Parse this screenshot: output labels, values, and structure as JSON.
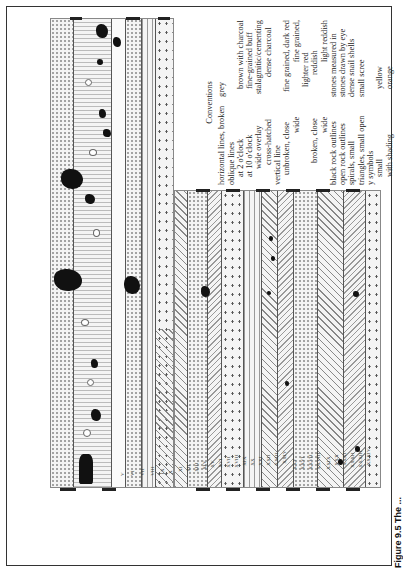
{
  "figure": {
    "caption": "Figure 9.5 The ...",
    "orientation": "rotated 90deg counter-clockwise"
  },
  "conventions": {
    "title": "Conventions",
    "rows": [
      {
        "pattern": "horizontal lines, broken",
        "meaning": "grey"
      },
      {
        "pattern": "oblique lines",
        "meaning": ""
      },
      {
        "pattern": "at 2 o'clock",
        "meaning": "brown with charcoal"
      },
      {
        "pattern": "at 10 o'clock",
        "meaning": "fine-grained buff"
      },
      {
        "pattern": "wide overlay",
        "meaning": "stalagmitic/cementing"
      },
      {
        "pattern": "cross-hatched",
        "meaning": "dense charcoal"
      },
      {
        "pattern": "vertical line",
        "meaning": ""
      },
      {
        "pattern": "unbroken, close",
        "meaning": "fine grained, dark red"
      },
      {
        "pattern": "wide",
        "meaning": "fine grained,"
      },
      {
        "pattern": "",
        "meaning": "lighter red"
      },
      {
        "pattern": "broken, close",
        "meaning": "reddish"
      },
      {
        "pattern": "wide",
        "meaning": "light reddish"
      },
      {
        "pattern": "black rock outlines",
        "meaning": "stones measured in"
      },
      {
        "pattern": "open rock outlines",
        "meaning": "stones drawn by eye"
      },
      {
        "pattern": "spirals, small",
        "meaning": "dense snail shells"
      },
      {
        "pattern": "triangles, small open",
        "meaning": "small scree"
      },
      {
        "pattern": "y symbols",
        "meaning": ""
      },
      {
        "pattern": "small",
        "meaning": "yellow"
      },
      {
        "pattern": "with shading",
        "meaning": "orange"
      }
    ]
  },
  "section_labels": {
    "upper": [
      "V",
      "VI",
      "VII",
      "VIII",
      "IX",
      "X"
    ],
    "lower": [
      "XI",
      "XII",
      "XIII",
      "XIV",
      "XV",
      "XVI",
      "XVII",
      "XVIII",
      "XIX",
      "XX",
      "XXI",
      "XXII",
      "XXIII",
      "XXIV",
      "XXV",
      "XXVI",
      "XXVII",
      "XXVIII",
      "XXIX",
      "XXX",
      "XXXI",
      "XXXII",
      "XXXIII",
      "XXXIV"
    ]
  },
  "colors": {
    "ink": "#111111",
    "paper": "#ffffff",
    "fill": "#f4f4f4"
  }
}
